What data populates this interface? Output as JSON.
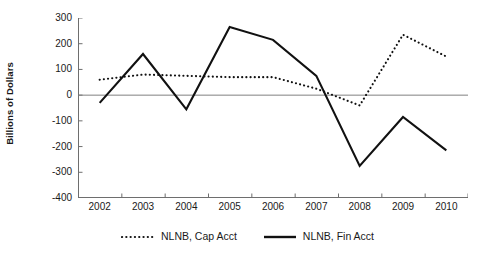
{
  "chart_data": {
    "type": "line",
    "title": "",
    "xlabel": "",
    "ylabel": "Billions of Dollars",
    "categories": [
      "2002",
      "2003",
      "2004",
      "2005",
      "2006",
      "2007",
      "2008",
      "2009",
      "2010"
    ],
    "x_tick_labels": [
      "2002",
      "2003",
      "2004",
      "2005",
      "2006",
      "2007",
      "2008",
      "2009",
      "2010"
    ],
    "y_tick_labels": [
      "300",
      "200",
      "100",
      "0",
      "-100",
      "-200",
      "-300",
      "-400"
    ],
    "y_ticks": [
      300,
      200,
      100,
      0,
      -100,
      -200,
      -300,
      -400
    ],
    "ylim": [
      -400,
      300
    ],
    "grid": false,
    "zero_line": true,
    "legend_position": "bottom",
    "series": [
      {
        "name": "NLNB, Cap Acct",
        "style": "dotted",
        "color": "#111111",
        "values": [
          60,
          80,
          75,
          70,
          70,
          25,
          -40,
          235,
          150
        ]
      },
      {
        "name": "NLNB, Fin Acct",
        "style": "solid",
        "color": "#111111",
        "values": [
          -30,
          160,
          -55,
          265,
          215,
          75,
          -275,
          -85,
          -215
        ]
      }
    ]
  },
  "legend": {
    "items": [
      {
        "label": "NLNB, Cap Acct",
        "key": "dotted-line-key"
      },
      {
        "label": "NLNB, Fin Acct",
        "key": "solid-line-key"
      }
    ]
  },
  "colors": {
    "axis": "#6e6e6e",
    "line": "#111111",
    "zero_line": "#808080",
    "background": "#ffffff"
  }
}
